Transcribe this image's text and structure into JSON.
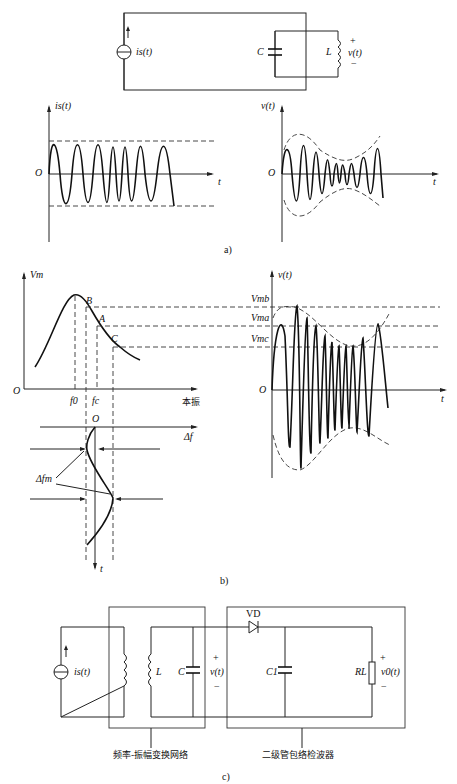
{
  "figure_a": {
    "circuit": {
      "source_label": "i_s(t)",
      "capacitor_label": "C",
      "inductor_label": "L",
      "voltage_label": "v(t)",
      "plus": "+",
      "minus": "−"
    },
    "plot_left": {
      "ylabel": "i_s(t)",
      "origin": "O",
      "xlabel": "t"
    },
    "plot_right": {
      "ylabel": "v(t)",
      "origin": "O",
      "xlabel": "t"
    },
    "caption": "a)"
  },
  "figure_b": {
    "resonance_plot": {
      "ylabel": "V_m",
      "origin": "O",
      "xlabel": "本振",
      "points": [
        "B",
        "A",
        "C"
      ],
      "ticks": [
        "f_0",
        "f_c"
      ]
    },
    "deviation_plot": {
      "origin": "O",
      "xlabel": "Δf",
      "ylabel": "t",
      "annotation": "Δf_m"
    },
    "waveform_plot": {
      "ylabel": "v(t)",
      "origin": "O",
      "xlabel": "t",
      "levels": [
        "V_mb",
        "V_ma",
        "V_mc"
      ]
    },
    "caption": "b)"
  },
  "figure_c": {
    "source_label": "i_s(t)",
    "inductor_label": "L",
    "capacitor_label": "C",
    "voltage_label": "v(t)",
    "diode_label": "VD",
    "filter_cap_label": "C_1",
    "load_label": "R_L",
    "output_label": "v_0(t)",
    "plus": "+",
    "minus": "−",
    "block1_label": "频率-振幅变换网络",
    "block2_label": "二级管包络检波器",
    "caption": "c)"
  },
  "labels_display": {
    "is": "is(t)",
    "vt": "v(t)",
    "C": "C",
    "L": "L",
    "O": "O",
    "t": "t",
    "Vm": "Vm",
    "B": "B",
    "A": "A",
    "Cpt": "C",
    "f0": "f0",
    "fc": "fc",
    "df": "Δf",
    "dfm": "Δfm",
    "Vmb": "Vmb",
    "Vma": "Vma",
    "Vmc": "Vmc",
    "VD": "VD",
    "C1": "C1",
    "RL": "RL",
    "v0": "v0(t)"
  }
}
